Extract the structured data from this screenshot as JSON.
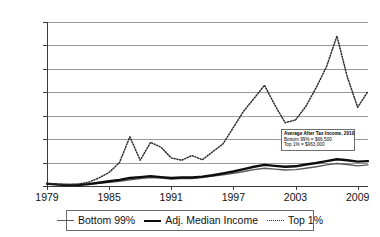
{
  "chart_data": {
    "type": "line",
    "title": "",
    "xlabel": "",
    "ylabel": "",
    "x": [
      1979,
      1980,
      1981,
      1982,
      1983,
      1984,
      1985,
      1986,
      1987,
      1988,
      1989,
      1990,
      1991,
      1992,
      1993,
      1994,
      1995,
      1996,
      1997,
      1998,
      1999,
      2000,
      2001,
      2002,
      2003,
      2004,
      2005,
      2006,
      2007,
      2008,
      2009,
      2010
    ],
    "xlim": [
      1979,
      2010
    ],
    "ylim": [
      -5,
      345
    ],
    "ytick_labels": [
      "345%",
      "295%",
      "245%",
      "195%",
      "145%",
      "95%",
      "45%",
      "-5%"
    ],
    "ytick_values": [
      345,
      295,
      245,
      195,
      145,
      95,
      45,
      -5
    ],
    "xtick_labels": [
      "1979",
      "1985",
      "1991",
      "1997",
      "2003",
      "2009"
    ],
    "xtick_values": [
      1979,
      1985,
      1991,
      1997,
      2003,
      2009
    ],
    "grid": "horizontal",
    "legend_position": "bottom",
    "series": [
      {
        "name": "Bottom 99%",
        "style": "solid-thin",
        "color": "#5a5a5a",
        "values": [
          0,
          -1,
          -2,
          -2,
          -1,
          1,
          3,
          5,
          8,
          11,
          13,
          12,
          10,
          11,
          11,
          13,
          16,
          19,
          22,
          26,
          30,
          33,
          31,
          29,
          30,
          33,
          36,
          40,
          43,
          41,
          38,
          40
        ]
      },
      {
        "name": "Adj. Median Income",
        "style": "solid-thick",
        "color": "#0d0d0d",
        "values": [
          0,
          -2,
          -3,
          -3,
          -1,
          2,
          5,
          8,
          12,
          14,
          16,
          14,
          12,
          13,
          13,
          15,
          18,
          22,
          26,
          31,
          36,
          40,
          38,
          36,
          37,
          41,
          44,
          48,
          52,
          50,
          47,
          48
        ]
      },
      {
        "name": "Top 1%",
        "style": "dotted",
        "color": "#2b2b2b",
        "values": [
          0,
          -1,
          -2,
          -1,
          3,
          12,
          24,
          45,
          100,
          50,
          88,
          78,
          55,
          50,
          60,
          51,
          68,
          85,
          120,
          155,
          182,
          210,
          168,
          130,
          136,
          165,
          205,
          250,
          315,
          228,
          163,
          197
        ]
      }
    ],
    "annotation": {
      "title": "Average After Tax Income, 2010",
      "line1": "Bottom 99% = $66,500",
      "line2": "Top 1% = $963,000"
    }
  },
  "legend": {
    "items": [
      {
        "label": "Bottom 99%"
      },
      {
        "label": "Adj. Median Income"
      },
      {
        "label": "Top 1%"
      }
    ]
  }
}
